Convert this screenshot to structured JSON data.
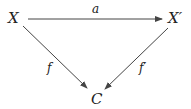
{
  "diagram": {
    "type": "commutative-triangle",
    "nodes": [
      {
        "id": "X",
        "label": "X",
        "x": 15,
        "y": 22
      },
      {
        "id": "Xp",
        "label": "X′",
        "x": 177,
        "y": 22
      },
      {
        "id": "C",
        "label": "C",
        "x": 97,
        "y": 103
      }
    ],
    "edges": [
      {
        "from": "X",
        "to": "Xp",
        "label": "a"
      },
      {
        "from": "X",
        "to": "C",
        "label": "f"
      },
      {
        "from": "Xp",
        "to": "C",
        "label": "f′"
      }
    ],
    "colors": {
      "line": "#444444",
      "text": "#222222",
      "background": "#ffffff"
    }
  }
}
